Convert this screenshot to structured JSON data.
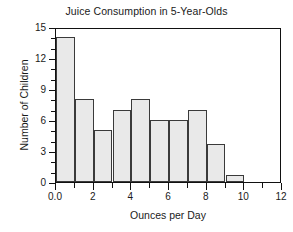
{
  "chart_data": {
    "type": "bar",
    "title": "Juice Consumption in 5-Year-Olds",
    "xlabel": "Ounces per Day",
    "ylabel": "Number of Children",
    "xlim": [
      0,
      12
    ],
    "ylim": [
      0,
      15
    ],
    "grid": false,
    "legend": null,
    "bin_width": 1,
    "categories": [
      "0-1",
      "1-2",
      "2-3",
      "3-4",
      "4-5",
      "5-6",
      "6-7",
      "7-8",
      "8-9",
      "9-10"
    ],
    "bin_edges": [
      0,
      1,
      2,
      3,
      4,
      5,
      6,
      7,
      8,
      9,
      10
    ],
    "values": [
      14,
      8,
      5,
      7,
      8,
      6,
      6,
      7,
      3.7,
      0.7
    ],
    "bars": [
      {
        "x0": 0,
        "x1": 1,
        "value": 14
      },
      {
        "x0": 1,
        "x1": 2,
        "value": 8
      },
      {
        "x0": 2,
        "x1": 3,
        "value": 5
      },
      {
        "x0": 3,
        "x1": 4,
        "value": 7
      },
      {
        "x0": 4,
        "x1": 5,
        "value": 8
      },
      {
        "x0": 5,
        "x1": 6,
        "value": 6
      },
      {
        "x0": 6,
        "x1": 7,
        "value": 6
      },
      {
        "x0": 7,
        "x1": 8,
        "value": 7
      },
      {
        "x0": 8,
        "x1": 9,
        "value": 3.7
      },
      {
        "x0": 9,
        "x1": 10,
        "value": 0.7
      }
    ],
    "yticks": [
      0,
      3,
      6,
      9,
      12,
      15
    ],
    "ytick_labels": [
      "0",
      "3",
      "6",
      "9",
      "12",
      "15"
    ],
    "yticks_minor": [
      1,
      2,
      4,
      5,
      7,
      8,
      10,
      11,
      13,
      14
    ],
    "xticks": [
      0,
      2,
      4,
      6,
      8,
      10,
      12
    ],
    "xtick_labels": [
      "0.0",
      "2",
      "4",
      "6",
      "8",
      "10",
      "12"
    ],
    "xticks_minor": [
      1,
      3,
      5,
      7,
      9,
      11
    ],
    "colors": {
      "bar_fill": "#e9e9e9",
      "bar_edge": "#3a3a3a",
      "axis": "#111111",
      "text": "#1a1a1a",
      "background": "#ffffff"
    }
  }
}
